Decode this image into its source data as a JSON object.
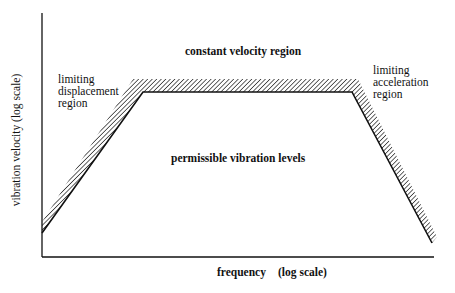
{
  "diagram": {
    "axes": {
      "y_label": "vibration velocity (log scale)",
      "x_label_main": "frequency",
      "x_label_scale": "(log scale)"
    },
    "regions": {
      "constant_velocity": "constant velocity region",
      "limiting_displacement": [
        "limiting",
        "displacement",
        "region"
      ],
      "limiting_acceleration": [
        "limiting",
        "acceleration",
        "region"
      ],
      "permissible": "permissible vibration levels"
    },
    "colors": {
      "ink": "#111111",
      "background": "#ffffff"
    }
  }
}
